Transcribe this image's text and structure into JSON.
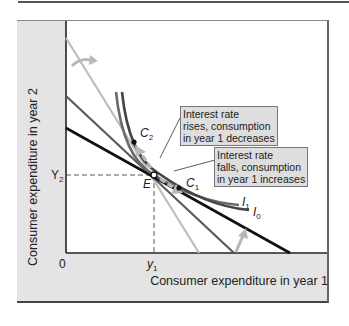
{
  "figure": {
    "type": "intertemporal-consumption-diagram",
    "axes": {
      "y_label": "Consumer expenditure in year 2",
      "x_label": "Consumer expenditure in year 1",
      "origin_label": "0",
      "y_tick": {
        "label": "Y",
        "subscript": "2"
      },
      "x_tick": {
        "label": "y",
        "subscript": "1"
      }
    },
    "points": [
      {
        "name": "E",
        "label": "E",
        "subscript": ""
      },
      {
        "name": "C2",
        "label": "C",
        "subscript": "2"
      },
      {
        "name": "C1",
        "label": "C",
        "subscript": "1"
      }
    ],
    "curves": [
      {
        "name": "I1",
        "label": "I",
        "subscript": "1"
      },
      {
        "name": "I0",
        "label": "I",
        "subscript": "0"
      }
    ],
    "budget_lines": [
      {
        "name": "high-interest-line",
        "color": "#bdbdbd"
      },
      {
        "name": "original-line",
        "color": "#5a5a5a"
      },
      {
        "name": "low-interest-line",
        "color": "#111111"
      }
    ],
    "callouts": [
      {
        "name": "rate-rises",
        "lines": [
          "Interest rate",
          "rises, consumption",
          "in year 1 decreases"
        ]
      },
      {
        "name": "rate-falls",
        "lines": [
          "Interest rate",
          "falls, consumption",
          "in year 1 increases"
        ]
      }
    ],
    "colors": {
      "panel_gray": "#e4e4e4",
      "arrow_gray": "#b8b8b8",
      "curve_dark": "#444444",
      "curve_mid": "#6a6a6a"
    }
  }
}
